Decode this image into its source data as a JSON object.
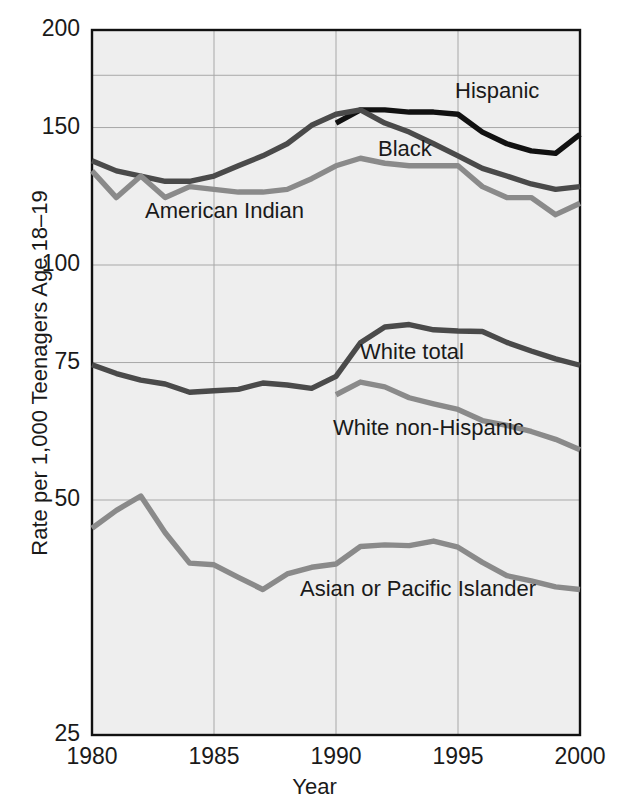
{
  "chart_data": {
    "type": "line",
    "title": "",
    "xlabel": "Year",
    "ylabel": "Rate per 1,000 Teenagers Age 18–19",
    "x": [
      1980,
      1981,
      1982,
      1983,
      1984,
      1985,
      1986,
      1987,
      1988,
      1989,
      1990,
      1991,
      1992,
      1993,
      1994,
      1995,
      1996,
      1997,
      1998,
      1999,
      2000
    ],
    "xlim": [
      1980,
      2000
    ],
    "ylim": [
      25,
      200
    ],
    "yscale": "log",
    "xticks": [
      "1980",
      "1985",
      "1990",
      "1995",
      "2000"
    ],
    "yticks": [
      "200",
      "150",
      "100",
      "75",
      "50",
      "25"
    ],
    "ytick_values": [
      200,
      150,
      100,
      75,
      50,
      25
    ],
    "gridlines": [
      200,
      175,
      150,
      100,
      75,
      50,
      25
    ],
    "grid": true,
    "legend": "inline-labels",
    "plot_background": "#eeeeee",
    "series": [
      {
        "name": "Hispanic",
        "color": "#111111",
        "label_x": 455,
        "label_y": 78,
        "x": [
          1990,
          1991,
          1992,
          1993,
          1994,
          1995,
          1996,
          1997,
          1998,
          1999,
          2000
        ],
        "values": [
          152,
          158,
          158,
          157,
          157,
          156,
          148,
          143,
          140,
          139,
          147
        ]
      },
      {
        "name": "Black",
        "color": "#4a4a4a",
        "label_x": 378,
        "label_y": 136,
        "x": [
          1980,
          1981,
          1982,
          1983,
          1984,
          1985,
          1986,
          1987,
          1988,
          1989,
          1990,
          1991,
          1992,
          1993,
          1994,
          1995,
          1996,
          1997,
          1998,
          1999,
          2000
        ],
        "values": [
          136,
          132,
          130,
          128,
          128,
          130,
          134,
          138,
          143,
          151,
          156,
          158,
          152,
          148,
          143,
          138,
          133,
          130,
          127,
          125,
          126
        ]
      },
      {
        "name": "American Indian",
        "color": "#8a8a8a",
        "label_x": 145,
        "label_y": 198,
        "x": [
          1980,
          1981,
          1982,
          1983,
          1984,
          1985,
          1986,
          1987,
          1988,
          1989,
          1990,
          1991,
          1992,
          1993,
          1994,
          1995,
          1996,
          1997,
          1998,
          1999,
          2000
        ],
        "values": [
          132,
          122,
          130,
          122,
          126,
          125,
          124,
          124,
          125,
          129,
          134,
          137,
          135,
          134,
          134,
          134,
          126,
          122,
          122,
          116,
          120
        ]
      },
      {
        "name": "White total",
        "color": "#4a4a4a",
        "label_x": 360,
        "label_y": 339,
        "x": [
          1980,
          1981,
          1982,
          1983,
          1984,
          1985,
          1986,
          1987,
          1988,
          1989,
          1990,
          1991,
          1992,
          1993,
          1994,
          1995,
          1996,
          1997,
          1998,
          1999,
          2000
        ],
        "values": [
          74.5,
          72.6,
          71.2,
          70.4,
          68.7,
          69.0,
          69.3,
          70.6,
          70.2,
          69.5,
          72.0,
          79.5,
          83.3,
          83.9,
          82.6,
          82.3,
          82.2,
          79.6,
          77.6,
          75.8,
          74.4
        ]
      },
      {
        "name": "White non-Hispanic",
        "color": "#8a8a8a",
        "label_x": 333,
        "label_y": 415,
        "x": [
          1990,
          1991,
          1992,
          1993,
          1994,
          1995,
          1996,
          1997,
          1998,
          1999,
          2000
        ],
        "values": [
          68.2,
          70.8,
          69.8,
          67.6,
          66.4,
          65.3,
          63.2,
          62.3,
          61.2,
          59.8,
          58.0
        ]
      },
      {
        "name": "Asian or Pacific Islander",
        "color": "#8a8a8a",
        "label_x": 300,
        "label_y": 576,
        "x": [
          1980,
          1981,
          1982,
          1983,
          1984,
          1985,
          1986,
          1987,
          1988,
          1989,
          1990,
          1991,
          1992,
          1993,
          1994,
          1995,
          1996,
          1997,
          1998,
          1999,
          2000
        ],
        "values": [
          46.0,
          48.5,
          50.6,
          45.4,
          41.5,
          41.3,
          39.8,
          38.4,
          40.2,
          41.0,
          41.4,
          43.6,
          43.8,
          43.7,
          44.3,
          43.5,
          41.6,
          40.0,
          39.4,
          38.7,
          38.4
        ]
      }
    ]
  }
}
